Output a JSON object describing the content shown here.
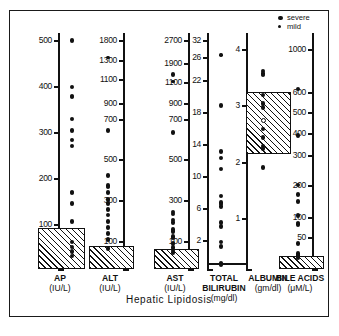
{
  "figure": {
    "title": "Hepatic  Lipidosis",
    "legend": [
      {
        "key": "severe",
        "label": "severe",
        "size": "large"
      },
      {
        "key": "mild",
        "label": "mild",
        "size": "small"
      }
    ]
  },
  "chart_data": {
    "type": "scatter",
    "title": "Hepatic Lipidosis",
    "grid": false,
    "legend_position": "top-right",
    "series_legend": [
      "severe",
      "mild"
    ],
    "panels": [
      {
        "name": "AP",
        "label": "AP",
        "units": "(IU/L)",
        "ylabel": "AP (IU/L)",
        "ticks": [
          100,
          200,
          300,
          400,
          500
        ],
        "ticklabels": [
          "100",
          "200",
          "300",
          "400",
          "500"
        ],
        "ylim": [
          0,
          520
        ],
        "reference_range": {
          "low": 0,
          "high": 95,
          "style": "hatched"
        },
        "values": [
          500,
          400,
          380,
          378,
          330,
          305,
          285,
          272,
          172,
          170,
          148,
          108,
          62,
          50,
          40,
          30
        ],
        "severity": [
          "severe",
          "severe",
          "severe",
          "severe",
          "severe",
          "severe",
          "severe",
          "severe",
          "severe",
          "severe",
          "severe",
          "severe",
          "severe",
          "severe",
          "severe",
          "severe"
        ]
      },
      {
        "name": "ALT",
        "label": "ALT",
        "units": "(IU/L)",
        "ylabel": "ALT (IU/L)",
        "ticks": [
          100,
          300,
          500,
          700,
          900,
          1100,
          1300,
          1800
        ],
        "ticklabels": [
          "100",
          "300",
          "500",
          "700",
          "900",
          "1100",
          "1300",
          "1800"
        ],
        "ylim": [
          0,
          1900
        ],
        "reference_range": {
          "low": 0,
          "high": 85,
          "style": "hatched"
        },
        "values": [
          1390,
          650,
          425,
          375,
          368,
          340,
          305,
          285,
          258,
          230,
          200,
          170,
          140,
          110,
          75
        ],
        "severity": [
          "mild",
          "severe",
          "severe",
          "severe",
          "severe",
          "severe",
          "severe",
          "severe",
          "severe",
          "severe",
          "severe",
          "severe",
          "severe",
          "severe",
          "severe"
        ]
      },
      {
        "name": "AST",
        "label": "AST",
        "units": "(IU/L)",
        "ylabel": "AST (IU/L)",
        "ticks": [
          100,
          300,
          500,
          700,
          900,
          1100,
          1900,
          2700
        ],
        "ticklabels": [
          "100",
          "300",
          "500",
          "700",
          "900",
          "1100",
          "1900",
          "2700"
        ],
        "ylim": [
          0,
          2800
        ],
        "reference_range": {
          "low": 0,
          "high": 75,
          "style": "hatched"
        },
        "values": [
          1150,
          1450,
          640,
          245,
          235,
          205,
          195,
          160,
          150,
          125,
          118,
          95,
          80,
          70,
          60
        ],
        "severity": [
          "mild",
          "severe",
          "severe",
          "severe",
          "severe",
          "severe",
          "severe",
          "severe",
          "severe",
          "severe",
          "severe",
          "severe",
          "severe",
          "severe",
          "severe"
        ]
      },
      {
        "name": "TOTAL BILIRUBIN",
        "label": "TOTAL BILIRUBIN",
        "units": "(mg/dl)",
        "ylabel": "TOTAL BILIRUBIN (mg/dl)",
        "ticks": [
          2,
          6,
          10,
          14,
          18,
          22,
          26,
          32
        ],
        "ticklabels": [
          "2",
          "6",
          "10",
          "14",
          "18",
          "22",
          "26",
          "32"
        ],
        "ylim": [
          0,
          33
        ],
        "reference_range": {
          "low": 0,
          "high": 0.4,
          "style": "solid-line"
        },
        "values": [
          27,
          19,
          13.2,
          12.4,
          11,
          7.6,
          6.8,
          6.6,
          6.3,
          4.3,
          3.8,
          1.9,
          1.6,
          0.4,
          0.3
        ],
        "severity": [
          "mild",
          "severe",
          "severe",
          "severe",
          "severe",
          "severe",
          "severe",
          "severe",
          "severe",
          "severe",
          "severe",
          "severe",
          "severe",
          "severe",
          "severe"
        ]
      },
      {
        "name": "ALBUMIN",
        "label": "ALBUMIN",
        "units": "(gm/dl)",
        "ylabel": "ALBUMIN (gm/dl)",
        "ticks": [
          1,
          2,
          3,
          4
        ],
        "ticklabels": [
          "1",
          "2",
          "3",
          "4"
        ],
        "ylim": [
          0.3,
          4.4
        ],
        "reference_range": {
          "low": 2.15,
          "high": 3.25,
          "style": "hatched"
        },
        "values": [
          3.62,
          3.58,
          3.55,
          3.2,
          3.05,
          2.98,
          2.75,
          2.6,
          2.45,
          2.3,
          2.25,
          1.92
        ],
        "severity": [
          "severe",
          "severe",
          "severe",
          "severe",
          "severe",
          "severe",
          "open",
          "severe",
          "severe",
          "severe",
          "severe",
          "severe"
        ]
      },
      {
        "name": "BILE ACIDS",
        "label": "BILE ACIDS",
        "units": "(μM/L)",
        "ylabel": "BILE ACIDS (μM/L)",
        "ticks": [
          50,
          100,
          200,
          300,
          400,
          500,
          600,
          1000
        ],
        "ticklabels": [
          "50",
          "100",
          "200",
          "300",
          "400",
          "500",
          "600",
          "1000"
        ],
        "ylim": [
          0,
          1100
        ],
        "reference_range": {
          "low": 0,
          "high": 22,
          "style": "hatched"
        },
        "values": [
          640,
          395,
          205,
          175,
          152,
          108,
          88,
          85,
          42,
          25,
          22,
          20,
          18
        ],
        "severity": [
          "severe",
          "severe",
          "severe",
          "severe",
          "severe",
          "severe",
          "severe",
          "severe",
          "severe",
          "severe",
          "severe",
          "severe",
          "severe"
        ]
      }
    ]
  }
}
